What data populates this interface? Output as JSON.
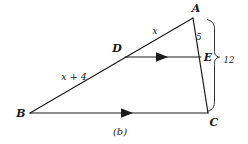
{
  "figure": {
    "caption": "(b)",
    "vertices": [
      {
        "name": "A",
        "label": "A",
        "x": 193,
        "y": 18,
        "label_x": 196,
        "label_y": 8
      },
      {
        "name": "B",
        "label": "B",
        "x": 30,
        "y": 113,
        "label_x": 21,
        "label_y": 113
      },
      {
        "name": "C",
        "label": "C",
        "x": 208,
        "y": 113,
        "label_x": 214,
        "label_y": 122
      },
      {
        "name": "D",
        "label": "D",
        "x": 125,
        "y": 57,
        "label_x": 117,
        "label_y": 48
      },
      {
        "name": "E",
        "label": "E",
        "x": 201,
        "y": 57,
        "label_x": 208,
        "label_y": 57
      }
    ],
    "segment_labels": [
      {
        "name": "ad-length",
        "text": "x",
        "x": 155,
        "y": 31
      },
      {
        "name": "db-length",
        "text": "x + 4",
        "x": 74,
        "y": 77
      },
      {
        "name": "ae-length",
        "text": "5",
        "x": 199,
        "y": 37
      },
      {
        "name": "ac-length",
        "text": "12",
        "x": 229,
        "y": 60
      }
    ],
    "caption_pos": {
      "x": 120,
      "y": 132
    },
    "colors": {
      "stroke": "#1a1a1a",
      "text": "#1a1a1a",
      "background": "#ffffff"
    }
  }
}
